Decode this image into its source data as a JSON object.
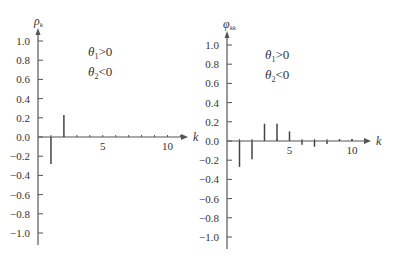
{
  "chart_data": [
    {
      "type": "bar",
      "subtype": "stem",
      "title": "",
      "ylabel": "ρ_k",
      "xlabel": "k",
      "annotations": [
        "θ1>0",
        "θ2<0"
      ],
      "x": [
        1,
        2,
        3,
        4,
        5,
        6,
        7,
        8,
        9,
        10
      ],
      "values": [
        -0.28,
        0.23,
        0,
        0,
        0,
        0,
        0,
        0,
        0,
        0
      ],
      "yticks": [
        1.0,
        0.8,
        0.6,
        0.4,
        0.2,
        0.0,
        -0.2,
        -0.4,
        -0.6,
        -0.8,
        -1.0
      ],
      "ytick_labels": [
        "1.0",
        "0.8",
        "0.6",
        "0.4",
        "0.2",
        "0.0",
        "−0.2",
        "−0.4",
        "−0.6",
        "−0.8",
        "−1.0"
      ],
      "xtick_labels": {
        "5": "5",
        "10": "10"
      },
      "ylim": [
        -1.1,
        1.1
      ],
      "grid": false
    },
    {
      "type": "bar",
      "subtype": "stem",
      "title": "",
      "ylabel": "φ_kk",
      "xlabel": "k",
      "annotations": [
        "θ1>0",
        "θ2<0"
      ],
      "x": [
        1,
        2,
        3,
        4,
        5,
        6,
        7,
        8,
        9,
        10
      ],
      "values": [
        -0.27,
        -0.19,
        0.18,
        0.18,
        0.1,
        -0.04,
        -0.06,
        -0.03,
        0.02,
        0.02
      ],
      "yticks": [
        1.0,
        0.8,
        0.6,
        0.4,
        0.2,
        0.0,
        -0.2,
        -0.4,
        -0.6,
        -0.8,
        -1.0
      ],
      "ytick_labels": [
        "1.0",
        "0.8",
        "0.6",
        "0.4",
        "0.2",
        "0.0",
        "−0.2",
        "−0.4",
        "−0.6",
        "−0.8",
        "−1.0"
      ],
      "xtick_labels": {
        "5": "5",
        "10": "10"
      },
      "ylim": [
        -1.1,
        1.1
      ],
      "grid": false
    }
  ],
  "left": {
    "ylabel_main": "ρ",
    "ylabel_sub": "k",
    "xlabel": "k",
    "annot1_main": "θ",
    "annot1_sub": "1",
    "annot1_rel": ">0",
    "annot2_main": "θ",
    "annot2_sub": "2",
    "annot2_rel": "<0"
  },
  "right": {
    "ylabel_main": "φ",
    "ylabel_sub": "kk",
    "xlabel": "k",
    "annot1_main": "θ",
    "annot1_sub": "1",
    "annot1_rel": ">0",
    "annot2_main": "θ",
    "annot2_sub": "2",
    "annot2_rel": "<0"
  },
  "colors": {
    "axis": "#555555",
    "stem": "#444444",
    "text": "#333333"
  }
}
